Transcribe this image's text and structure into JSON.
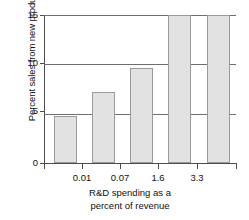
{
  "chart_data": {
    "type": "bar",
    "title": "",
    "xlabel": "R&D spending as a percent of revenue",
    "xlabel_line1": "R&D spending as a",
    "xlabel_line2": "percent of revenue",
    "ylabel": "Percent sales from new products",
    "categories": [
      "0.01",
      "0.07",
      "1.6",
      "3.3",
      ""
    ],
    "xtick_labels": [
      "0.01",
      "0.07",
      "1.6",
      "3.3"
    ],
    "values": [
      3.5,
      4.8,
      7.2,
      9.6,
      15.0
    ],
    "ylim": [
      0,
      15
    ],
    "ytick_labels": [
      "0",
      "5",
      "10",
      "15"
    ],
    "ytick_values": [
      0,
      5,
      10,
      15
    ],
    "grid": true,
    "legend": "none",
    "bar_fill_color": "#e2e2e2",
    "bar_border_color": "#9a9a9a",
    "axis_color": "#4d4d4d",
    "grid_color": "#6e6e6e",
    "background_color": "#ffffff"
  }
}
